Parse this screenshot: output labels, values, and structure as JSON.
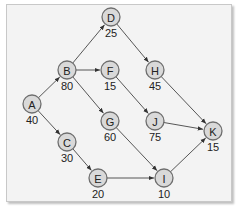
{
  "diagram": {
    "type": "directed-network",
    "nodes": [
      {
        "id": "A",
        "label": "A",
        "value": "40",
        "x": 32,
        "y": 104
      },
      {
        "id": "B",
        "label": "B",
        "value": "80",
        "x": 67,
        "y": 70
      },
      {
        "id": "C",
        "label": "C",
        "value": "30",
        "x": 67,
        "y": 142
      },
      {
        "id": "D",
        "label": "D",
        "value": "25",
        "x": 111,
        "y": 17
      },
      {
        "id": "E",
        "label": "E",
        "value": "20",
        "x": 98,
        "y": 178
      },
      {
        "id": "F",
        "label": "F",
        "value": "15",
        "x": 110,
        "y": 70
      },
      {
        "id": "G",
        "label": "G",
        "value": "60",
        "x": 110,
        "y": 121
      },
      {
        "id": "H",
        "label": "H",
        "value": "45",
        "x": 155,
        "y": 70
      },
      {
        "id": "I",
        "label": "I",
        "value": "10",
        "x": 164,
        "y": 178
      },
      {
        "id": "J",
        "label": "J",
        "value": "75",
        "x": 155,
        "y": 121
      },
      {
        "id": "K",
        "label": "K",
        "value": "15",
        "x": 213,
        "y": 131
      }
    ],
    "edges": [
      {
        "from": "A",
        "to": "B"
      },
      {
        "from": "A",
        "to": "C"
      },
      {
        "from": "B",
        "to": "D"
      },
      {
        "from": "B",
        "to": "F"
      },
      {
        "from": "B",
        "to": "G"
      },
      {
        "from": "C",
        "to": "E"
      },
      {
        "from": "D",
        "to": "H"
      },
      {
        "from": "F",
        "to": "J"
      },
      {
        "from": "G",
        "to": "I"
      },
      {
        "from": "E",
        "to": "I"
      },
      {
        "from": "H",
        "to": "K"
      },
      {
        "from": "J",
        "to": "K"
      },
      {
        "from": "I",
        "to": "K"
      }
    ],
    "colors": {
      "node_fill": "#d9d9d9",
      "node_stroke": "#6e6e6e",
      "edge": "#444444",
      "background": "#f3f3f3"
    }
  }
}
